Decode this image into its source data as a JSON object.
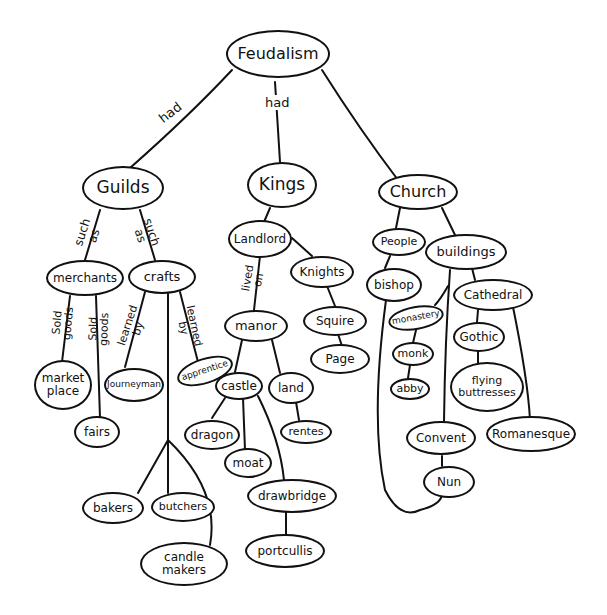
{
  "diagram": {
    "type": "concept-map",
    "root": "Feudalism",
    "nodes": {
      "feudalism": "Feudalism",
      "guilds": "Guilds",
      "kings": "Kings",
      "church": "Church",
      "merchants": "merchants",
      "crafts": "crafts",
      "market_place": "market\nplace",
      "fairs": "fairs",
      "journeyman": "Journeyman",
      "apprentice": "apprentice",
      "bakers": "bakers",
      "butchers": "butchers",
      "candle_makers": "candle\nmakers",
      "landlord": "Landlord",
      "knights": "Knights",
      "squire": "Squire",
      "page": "Page",
      "manor": "manor",
      "castle": "castle",
      "land": "land",
      "rents": "rentes",
      "dragon": "dragon",
      "moat": "moat",
      "drawbridge": "drawbridge",
      "portcullis": "portcullis",
      "people": "People",
      "bishop": "bishop",
      "buildings": "buildings",
      "monastery": "monastery",
      "monk": "monk",
      "abby": "abby",
      "cathedral": "Cathedral",
      "gothic": "Gothic",
      "flying_buttresses": "flying\nbuttresses",
      "convent": "Convent",
      "nun": "Nun",
      "romanesque": "Romanesque"
    },
    "edge_labels": {
      "feudalism_guilds": "had",
      "feudalism_kings": "had",
      "guilds_merchants": "such\nas",
      "guilds_crafts": "such\nas",
      "merchants_market": "Sold\ngoods",
      "merchants_fairs": "Sold\ngoods",
      "crafts_journeyman": "learned\nby",
      "crafts_apprentice": "learned\nby",
      "landlord_manor": "lived\non"
    },
    "edges": [
      [
        "Feudalism",
        "Guilds",
        "had"
      ],
      [
        "Feudalism",
        "Kings",
        "had"
      ],
      [
        "Feudalism",
        "Church",
        ""
      ],
      [
        "Guilds",
        "merchants",
        "such as"
      ],
      [
        "Guilds",
        "crafts",
        "such as"
      ],
      [
        "merchants",
        "market place",
        "Sold goods"
      ],
      [
        "merchants",
        "fairs",
        "Sold goods"
      ],
      [
        "crafts",
        "Journeyman",
        "learned by"
      ],
      [
        "crafts",
        "apprentice",
        "learned by"
      ],
      [
        "crafts",
        "bakers",
        ""
      ],
      [
        "crafts",
        "butchers",
        ""
      ],
      [
        "crafts",
        "candle makers",
        ""
      ],
      [
        "Kings",
        "Landlord",
        ""
      ],
      [
        "Landlord",
        "Knights",
        ""
      ],
      [
        "Knights",
        "Squire",
        ""
      ],
      [
        "Squire",
        "Page",
        ""
      ],
      [
        "Landlord",
        "manor",
        "lived on"
      ],
      [
        "manor",
        "castle",
        ""
      ],
      [
        "manor",
        "land",
        ""
      ],
      [
        "land",
        "rentes",
        ""
      ],
      [
        "castle",
        "dragon",
        ""
      ],
      [
        "castle",
        "moat",
        ""
      ],
      [
        "castle",
        "drawbridge",
        ""
      ],
      [
        "drawbridge",
        "portcullis",
        ""
      ],
      [
        "Church",
        "People",
        ""
      ],
      [
        "Church",
        "buildings",
        ""
      ],
      [
        "People",
        "bishop",
        ""
      ],
      [
        "bishop",
        "Nun",
        ""
      ],
      [
        "buildings",
        "monastery",
        ""
      ],
      [
        "monastery",
        "monk",
        ""
      ],
      [
        "monk",
        "abby",
        ""
      ],
      [
        "buildings",
        "Convent",
        ""
      ],
      [
        "Convent",
        "Nun",
        ""
      ],
      [
        "buildings",
        "Cathedral",
        ""
      ],
      [
        "Cathedral",
        "Gothic",
        ""
      ],
      [
        "Gothic",
        "flying buttresses",
        ""
      ],
      [
        "Cathedral",
        "Romanesque",
        ""
      ]
    ]
  }
}
